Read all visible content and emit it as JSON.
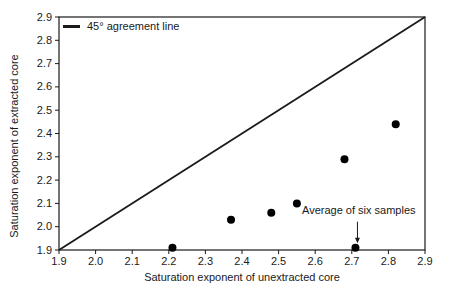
{
  "figure": {
    "background": "#ffffff",
    "ink_color": "#1a1a1a",
    "point_color": "#000000"
  },
  "chart_data": {
    "type": "scatter",
    "title": "",
    "xlabel": "Saturation exponent of unextracted core",
    "ylabel": "Saturation exponent of extracted core",
    "xlim": [
      1.9,
      2.9
    ],
    "ylim": [
      1.9,
      2.9
    ],
    "xticks": [
      1.9,
      2.0,
      2.1,
      2.2,
      2.3,
      2.4,
      2.5,
      2.6,
      2.7,
      2.8,
      2.9
    ],
    "yticks": [
      1.9,
      2.0,
      2.1,
      2.2,
      2.3,
      2.4,
      2.5,
      2.6,
      2.7,
      2.8,
      2.9
    ],
    "grid": false,
    "legend": {
      "position": "top-left",
      "entries": [
        {
          "label": "45° agreement line",
          "type": "line"
        }
      ]
    },
    "agreement_line": {
      "from": [
        1.9,
        1.9
      ],
      "to": [
        2.9,
        2.9
      ]
    },
    "points": [
      {
        "x": 2.21,
        "y": 1.91
      },
      {
        "x": 2.37,
        "y": 2.03
      },
      {
        "x": 2.48,
        "y": 2.06
      },
      {
        "x": 2.55,
        "y": 2.1
      },
      {
        "x": 2.68,
        "y": 2.29
      },
      {
        "x": 2.71,
        "y": 1.91
      },
      {
        "x": 2.82,
        "y": 2.44
      }
    ],
    "annotation": {
      "text": "Average of six samples",
      "target_point": {
        "x": 2.71,
        "y": 1.91
      },
      "arrow": "down"
    }
  }
}
